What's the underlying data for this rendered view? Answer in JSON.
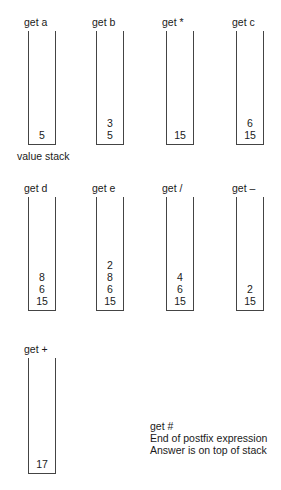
{
  "diagram": {
    "caption": "value stack",
    "steps": [
      {
        "label": "get  a",
        "stack": [
          "5"
        ]
      },
      {
        "label": "get  b",
        "stack": [
          "3",
          "5"
        ]
      },
      {
        "label": "get  *",
        "stack": [
          "15"
        ]
      },
      {
        "label": "get  c",
        "stack": [
          "6",
          "15"
        ]
      },
      {
        "label": "get  d",
        "stack": [
          "8",
          "6",
          "15"
        ]
      },
      {
        "label": "get  e",
        "stack": [
          "2",
          "8",
          "6",
          "15"
        ]
      },
      {
        "label": "get  /",
        "stack": [
          "4",
          "6",
          "15"
        ]
      },
      {
        "label": "get  –",
        "stack": [
          "2",
          "15"
        ]
      },
      {
        "label": "get  +",
        "stack": [
          "17"
        ]
      }
    ],
    "note": {
      "line1": "get #",
      "line2": "End of postfix expression",
      "line3": "Answer is on top of stack"
    }
  }
}
